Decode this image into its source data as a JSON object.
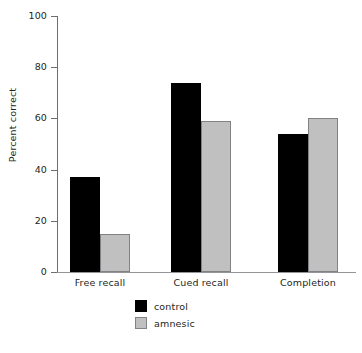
{
  "chart_data": {
    "type": "bar",
    "title": "",
    "xlabel": "",
    "ylabel": "Percent correct",
    "categories": [
      "Free recall",
      "Cued recall",
      "Completion"
    ],
    "series": [
      {
        "name": "control",
        "color": "#000000",
        "values": [
          37,
          74,
          54
        ]
      },
      {
        "name": "amnesic",
        "color": "#c0c0c0",
        "values": [
          15,
          59,
          60
        ]
      }
    ],
    "ylim": [
      0,
      100
    ],
    "yticks": [
      0,
      20,
      40,
      60,
      80,
      100
    ],
    "ytick_labels": [
      "0",
      "20",
      "40",
      "60",
      "80",
      "100"
    ],
    "grid": false,
    "legend_position": "bottom-center",
    "axis_color": "#6d6e70",
    "text_color": "#231f20",
    "background": "#ffffff"
  },
  "legend": {
    "items": [
      {
        "label": "control",
        "swatch": "black-square-swatch"
      },
      {
        "label": "amnesic",
        "swatch": "gray-square-swatch"
      }
    ]
  }
}
